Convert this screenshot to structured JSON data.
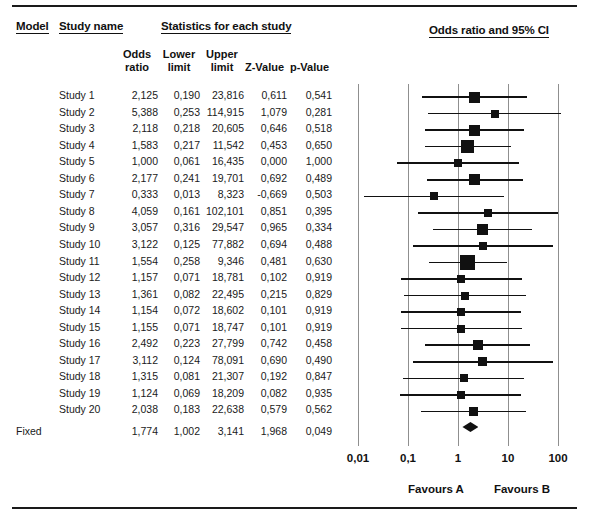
{
  "headers": {
    "model": "Model",
    "study_name": "Study name",
    "statistics": "Statistics for each study",
    "plot_title": "Odds ratio and 95% CI",
    "odds_ratio": "Odds\nratio",
    "lower_limit": "Lower\nlimit",
    "upper_limit": "Upper\nlimit",
    "z_value": "Z-Value",
    "p_value": "p-Value"
  },
  "axis": {
    "ticks": [
      "0,01",
      "0,1",
      "1",
      "10",
      "100"
    ],
    "tick_values": [
      0.01,
      0.1,
      1,
      10,
      100
    ],
    "favours_left": "Favours A",
    "favours_right": "Favours B"
  },
  "chart_data": {
    "type": "forest",
    "title": "Odds ratio and 95% CI",
    "xlabel": "Odds ratio",
    "xscale": "log",
    "xlim": [
      0.01,
      100
    ],
    "grid": true,
    "effect_measure": "Odds ratio",
    "model": "Fixed",
    "columns": [
      "Model",
      "Study name",
      "Odds ratio",
      "Lower limit",
      "Upper limit",
      "Z-Value",
      "p-Value"
    ],
    "rows": [
      {
        "model": "",
        "name": "Study 1",
        "or": "2,125",
        "low": "0,190",
        "up": "23,816",
        "z": "0,611",
        "p": "0,541",
        "or_v": 2.125,
        "low_v": 0.19,
        "up_v": 23.816,
        "w": 11
      },
      {
        "model": "",
        "name": "Study 2",
        "or": "5,388",
        "low": "0,253",
        "up": "114,915",
        "z": "1,079",
        "p": "0,281",
        "or_v": 5.388,
        "low_v": 0.253,
        "up_v": 114.915,
        "w": 8
      },
      {
        "model": "",
        "name": "Study 3",
        "or": "2,118",
        "low": "0,218",
        "up": "20,605",
        "z": "0,646",
        "p": "0,518",
        "or_v": 2.118,
        "low_v": 0.218,
        "up_v": 20.605,
        "w": 11
      },
      {
        "model": "",
        "name": "Study 4",
        "or": "1,583",
        "low": "0,217",
        "up": "11,542",
        "z": "0,453",
        "p": "0,650",
        "or_v": 1.583,
        "low_v": 0.217,
        "up_v": 11.542,
        "w": 13
      },
      {
        "model": "",
        "name": "Study 5",
        "or": "1,000",
        "low": "0,061",
        "up": "16,435",
        "z": "0,000",
        "p": "1,000",
        "or_v": 1.0,
        "low_v": 0.061,
        "up_v": 16.435,
        "w": 8
      },
      {
        "model": "",
        "name": "Study 6",
        "or": "2,177",
        "low": "0,241",
        "up": "19,701",
        "z": "0,692",
        "p": "0,489",
        "or_v": 2.177,
        "low_v": 0.241,
        "up_v": 19.701,
        "w": 11
      },
      {
        "model": "",
        "name": "Study 7",
        "or": "0,333",
        "low": "0,013",
        "up": "8,323",
        "z": "-0,669",
        "p": "0,503",
        "or_v": 0.333,
        "low_v": 0.013,
        "up_v": 8.323,
        "w": 8
      },
      {
        "model": "",
        "name": "Study 8",
        "or": "4,059",
        "low": "0,161",
        "up": "102,101",
        "z": "0,851",
        "p": "0,395",
        "or_v": 4.059,
        "low_v": 0.161,
        "up_v": 102.101,
        "w": 8
      },
      {
        "model": "",
        "name": "Study 9",
        "or": "3,057",
        "low": "0,316",
        "up": "29,547",
        "z": "0,965",
        "p": "0,334",
        "or_v": 3.057,
        "low_v": 0.316,
        "up_v": 29.547,
        "w": 11
      },
      {
        "model": "",
        "name": "Study 10",
        "or": "3,122",
        "low": "0,125",
        "up": "77,882",
        "z": "0,694",
        "p": "0,488",
        "or_v": 3.122,
        "low_v": 0.125,
        "up_v": 77.882,
        "w": 8
      },
      {
        "model": "",
        "name": "Study 11",
        "or": "1,554",
        "low": "0,258",
        "up": "9,346",
        "z": "0,481",
        "p": "0,630",
        "or_v": 1.554,
        "low_v": 0.258,
        "up_v": 9.346,
        "w": 15
      },
      {
        "model": "",
        "name": "Study 12",
        "or": "1,157",
        "low": "0,071",
        "up": "18,781",
        "z": "0,102",
        "p": "0,919",
        "or_v": 1.157,
        "low_v": 0.071,
        "up_v": 18.781,
        "w": 8
      },
      {
        "model": "",
        "name": "Study 13",
        "or": "1,361",
        "low": "0,082",
        "up": "22,495",
        "z": "0,215",
        "p": "0,829",
        "or_v": 1.361,
        "low_v": 0.082,
        "up_v": 22.495,
        "w": 8
      },
      {
        "model": "",
        "name": "Study 14",
        "or": "1,154",
        "low": "0,072",
        "up": "18,602",
        "z": "0,101",
        "p": "0,919",
        "or_v": 1.154,
        "low_v": 0.072,
        "up_v": 18.602,
        "w": 8
      },
      {
        "model": "",
        "name": "Study 15",
        "or": "1,155",
        "low": "0,071",
        "up": "18,747",
        "z": "0,101",
        "p": "0,919",
        "or_v": 1.155,
        "low_v": 0.071,
        "up_v": 18.747,
        "w": 8
      },
      {
        "model": "",
        "name": "Study 16",
        "or": "2,492",
        "low": "0,223",
        "up": "27,799",
        "z": "0,742",
        "p": "0,458",
        "or_v": 2.492,
        "low_v": 0.223,
        "up_v": 27.799,
        "w": 10
      },
      {
        "model": "",
        "name": "Study 17",
        "or": "3,112",
        "low": "0,124",
        "up": "78,091",
        "z": "0,690",
        "p": "0,490",
        "or_v": 3.112,
        "low_v": 0.124,
        "up_v": 78.091,
        "w": 9
      },
      {
        "model": "",
        "name": "Study 18",
        "or": "1,315",
        "low": "0,081",
        "up": "21,307",
        "z": "0,192",
        "p": "0,847",
        "or_v": 1.315,
        "low_v": 0.081,
        "up_v": 21.307,
        "w": 8
      },
      {
        "model": "",
        "name": "Study 19",
        "or": "1,124",
        "low": "0,069",
        "up": "18,209",
        "z": "0,082",
        "p": "0,935",
        "or_v": 1.124,
        "low_v": 0.069,
        "up_v": 18.209,
        "w": 8
      },
      {
        "model": "",
        "name": "Study 20",
        "or": "2,038",
        "low": "0,183",
        "up": "22,638",
        "z": "0,579",
        "p": "0,562",
        "or_v": 2.038,
        "low_v": 0.183,
        "up_v": 22.638,
        "w": 9
      }
    ],
    "summary": {
      "model": "Fixed",
      "name": "",
      "or": "1,774",
      "low": "1,002",
      "up": "3,141",
      "z": "1,968",
      "p": "0,049",
      "or_v": 1.774,
      "low_v": 1.002,
      "up_v": 3.141
    }
  }
}
